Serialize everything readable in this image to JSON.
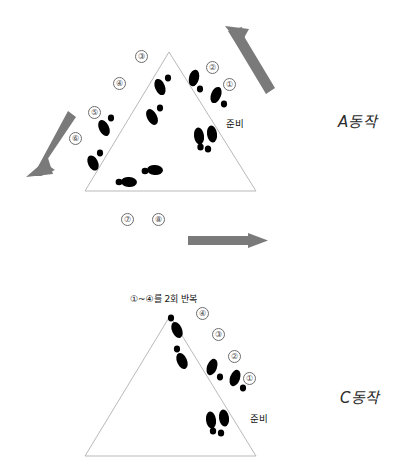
{
  "page": {
    "background": "#ffffff",
    "width": 406,
    "height": 476
  },
  "colors": {
    "triangle_stroke": "#b9b9b9",
    "arrow_fill": "#7a7a7a",
    "footprint_fill": "#000000",
    "circle_number_stroke": "#6d6d6d",
    "text": "#111111"
  },
  "panel_a": {
    "motion_label": "A동작",
    "ready_label": "준비",
    "steps": [
      {
        "id": "step-1",
        "label": "①"
      },
      {
        "id": "step-2",
        "label": "②"
      },
      {
        "id": "step-3",
        "label": "③"
      },
      {
        "id": "step-4",
        "label": "④"
      },
      {
        "id": "step-5",
        "label": "⑤"
      },
      {
        "id": "step-6",
        "label": "⑥"
      },
      {
        "id": "step-7",
        "label": "⑦"
      },
      {
        "id": "step-8",
        "label": "⑧"
      }
    ],
    "arrows": [
      {
        "id": "arrow-up-right",
        "direction": "up-right"
      },
      {
        "id": "arrow-down-left",
        "direction": "down-left"
      },
      {
        "id": "arrow-right",
        "direction": "right"
      }
    ]
  },
  "panel_c": {
    "motion_label": "C동작",
    "ready_label": "준비",
    "repeat_note": "①~④를 2회 반복",
    "steps": [
      {
        "id": "step-1",
        "label": "①"
      },
      {
        "id": "step-2",
        "label": "②"
      },
      {
        "id": "step-3",
        "label": "③"
      },
      {
        "id": "step-4",
        "label": "④"
      }
    ]
  }
}
